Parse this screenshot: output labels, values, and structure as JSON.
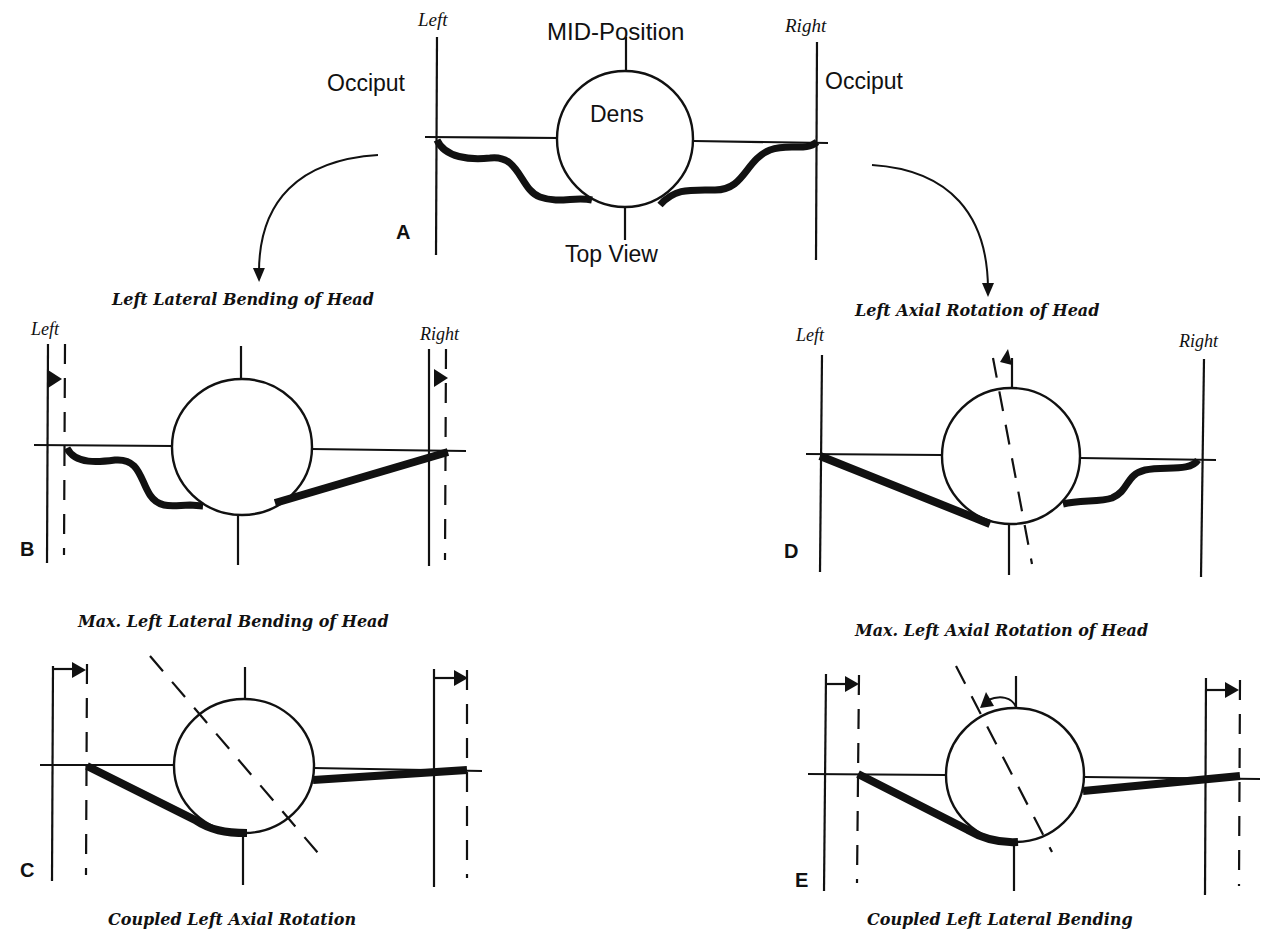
{
  "figure": {
    "panels": {
      "A": {
        "letter": "A",
        "title": "MID-Position",
        "subtitle": "Top View",
        "center_label": "Dens",
        "left_side": "Left",
        "right_side": "Right",
        "left_structure": "Occiput",
        "right_structure": "Occiput",
        "ligament_state": "both slack"
      },
      "B": {
        "letter": "B",
        "title": "Left Lateral Bending of Head",
        "left_side": "Left",
        "right_side": "Right",
        "ligament_state": "left slack, right taut"
      },
      "C": {
        "letter": "C",
        "title": "Max. Left Lateral Bending of Head",
        "caption": "Coupled Left Axial Rotation",
        "ligament_state": "both taut"
      },
      "D": {
        "letter": "D",
        "title": "Left Axial Rotation of Head",
        "left_side": "Left",
        "right_side": "Right",
        "ligament_state": "left taut, right slack"
      },
      "E": {
        "letter": "E",
        "title": "Max. Left Axial Rotation of Head",
        "caption": "Coupled Left Lateral Bending",
        "ligament_state": "both taut"
      }
    },
    "colors": {
      "ink": "#111111",
      "background": "#ffffff"
    }
  }
}
